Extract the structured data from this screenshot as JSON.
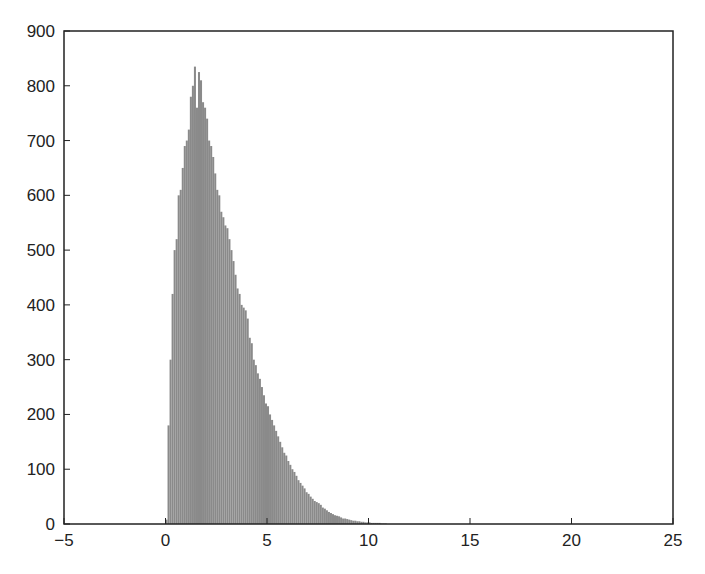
{
  "chart_data": {
    "type": "bar",
    "title": "",
    "xlabel": "",
    "ylabel": "",
    "xlim": [
      -5,
      25
    ],
    "ylim": [
      0,
      900
    ],
    "grid": false,
    "legend": null,
    "bar_color": "#8a8a8a",
    "bin_width": 0.1,
    "xticks": [
      -5,
      0,
      5,
      10,
      15,
      20,
      25
    ],
    "xtick_labels": [
      "-5",
      "0",
      "5",
      "10",
      "15",
      "20",
      "25"
    ],
    "yticks": [
      0,
      100,
      200,
      300,
      400,
      500,
      600,
      700,
      800,
      900
    ],
    "ytick_labels": [
      "0",
      "100",
      "200",
      "300",
      "400",
      "500",
      "600",
      "700",
      "800",
      "900"
    ],
    "x": [
      0.0,
      0.1,
      0.2,
      0.3,
      0.4,
      0.5,
      0.6,
      0.7,
      0.8,
      0.9,
      1.0,
      1.1,
      1.2,
      1.3,
      1.4,
      1.5,
      1.6,
      1.7,
      1.8,
      1.9,
      2.0,
      2.1,
      2.2,
      2.3,
      2.4,
      2.5,
      2.6,
      2.7,
      2.8,
      2.9,
      3.0,
      3.1,
      3.2,
      3.3,
      3.4,
      3.5,
      3.6,
      3.7,
      3.8,
      3.9,
      4.0,
      4.1,
      4.2,
      4.3,
      4.4,
      4.5,
      4.6,
      4.7,
      4.8,
      4.9,
      5.0,
      5.1,
      5.2,
      5.3,
      5.4,
      5.5,
      5.6,
      5.7,
      5.8,
      5.9,
      6.0,
      6.1,
      6.2,
      6.3,
      6.4,
      6.5,
      6.6,
      6.7,
      6.8,
      6.9,
      7.0,
      7.1,
      7.2,
      7.3,
      7.4,
      7.5,
      7.6,
      7.7,
      7.8,
      7.9,
      8.0,
      8.1,
      8.2,
      8.3,
      8.4,
      8.5,
      8.6,
      8.7,
      8.8,
      8.9,
      9.0,
      9.1,
      9.2,
      9.3,
      9.4,
      9.5,
      9.6,
      9.7,
      9.8,
      9.9,
      10.0,
      10.1,
      10.2,
      10.3,
      10.4,
      10.5,
      10.6,
      10.7,
      10.8
    ],
    "values": [
      8,
      180,
      300,
      420,
      500,
      520,
      600,
      610,
      650,
      690,
      700,
      720,
      780,
      800,
      835,
      760,
      825,
      810,
      770,
      760,
      740,
      700,
      690,
      670,
      640,
      610,
      600,
      570,
      560,
      545,
      540,
      520,
      500,
      480,
      455,
      430,
      420,
      400,
      395,
      390,
      375,
      340,
      330,
      300,
      290,
      275,
      265,
      250,
      235,
      220,
      215,
      200,
      190,
      180,
      170,
      160,
      150,
      140,
      130,
      125,
      115,
      108,
      100,
      95,
      88,
      80,
      75,
      70,
      65,
      58,
      55,
      50,
      46,
      42,
      40,
      38,
      35,
      30,
      28,
      25,
      22,
      20,
      18,
      16,
      15,
      14,
      12,
      10,
      10,
      9,
      8,
      7,
      6,
      6,
      5,
      5,
      4,
      4,
      3,
      3,
      3,
      2,
      2,
      2,
      2,
      2,
      1,
      1,
      1
    ]
  }
}
